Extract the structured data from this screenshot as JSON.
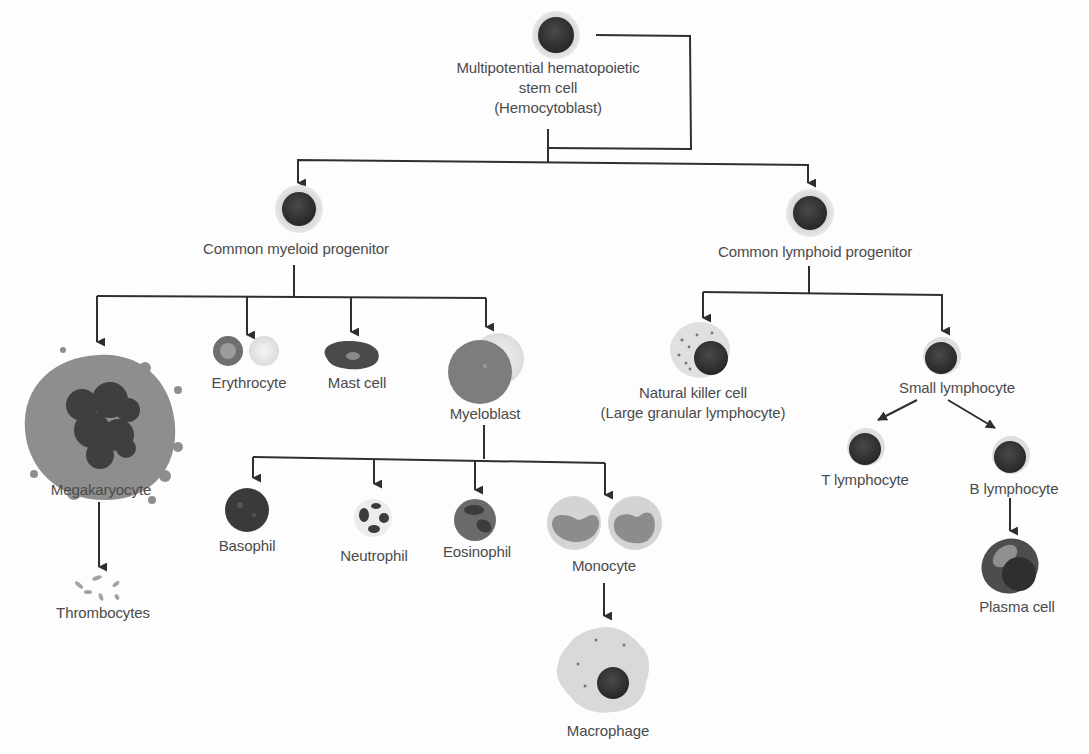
{
  "diagram": {
    "colors": {
      "line": "#2f2f2f",
      "text": "#4b4b4b",
      "nucleus": "#333333",
      "cytoplasm": "#c8c8c8",
      "membrane": "#dedede"
    },
    "nodes": {
      "stem": {
        "label_lines": [
          "Multipotential hematopoietic",
          "stem cell",
          "(Hemocytoblast)"
        ],
        "icon": "stem-cell-icon"
      },
      "myeloid": {
        "label": "Common myeloid progenitor",
        "icon": "progenitor-cell-icon"
      },
      "lymphoid": {
        "label": "Common lymphoid progenitor",
        "icon": "progenitor-cell-icon"
      },
      "megakaryocyte": {
        "label": "Megakaryocyte",
        "icon": "megakaryocyte-icon"
      },
      "thrombocytes": {
        "label": "Thrombocytes",
        "icon": "platelets-icon"
      },
      "erythrocyte": {
        "label": "Erythrocyte",
        "icon": "red-blood-cell-icon"
      },
      "mast": {
        "label": "Mast cell",
        "icon": "mast-cell-icon"
      },
      "myeloblast": {
        "label": "Myeloblast",
        "icon": "myeloblast-icon"
      },
      "basophil": {
        "label": "Basophil",
        "icon": "basophil-icon"
      },
      "neutrophil": {
        "label": "Neutrophil",
        "icon": "neutrophil-icon"
      },
      "eosinophil": {
        "label": "Eosinophil",
        "icon": "eosinophil-icon"
      },
      "monocyte": {
        "label": "Monocyte",
        "icon": "monocyte-icon"
      },
      "macrophage": {
        "label": "Macrophage",
        "icon": "macrophage-icon"
      },
      "nk": {
        "label_lines": [
          "Natural killer cell",
          "(Large granular lymphocyte)"
        ],
        "icon": "nk-cell-icon"
      },
      "small_lymphocyte": {
        "label": "Small lymphocyte",
        "icon": "lymphocyte-icon"
      },
      "t_lymphocyte": {
        "label": "T lymphocyte",
        "icon": "lymphocyte-icon"
      },
      "b_lymphocyte": {
        "label": "B lymphocyte",
        "icon": "lymphocyte-icon"
      },
      "plasma": {
        "label": "Plasma cell",
        "icon": "plasma-cell-icon"
      }
    },
    "edges": [
      [
        "stem",
        "stem (self-renewal loop)"
      ],
      [
        "stem",
        "myeloid"
      ],
      [
        "stem",
        "lymphoid"
      ],
      [
        "myeloid",
        "megakaryocyte"
      ],
      [
        "myeloid",
        "erythrocyte"
      ],
      [
        "myeloid",
        "mast"
      ],
      [
        "myeloid",
        "myeloblast"
      ],
      [
        "megakaryocyte",
        "thrombocytes"
      ],
      [
        "myeloblast",
        "basophil"
      ],
      [
        "myeloblast",
        "neutrophil"
      ],
      [
        "myeloblast",
        "eosinophil"
      ],
      [
        "myeloblast",
        "monocyte"
      ],
      [
        "monocyte",
        "macrophage"
      ],
      [
        "lymphoid",
        "nk"
      ],
      [
        "lymphoid",
        "small_lymphocyte"
      ],
      [
        "small_lymphocyte",
        "t_lymphocyte"
      ],
      [
        "small_lymphocyte",
        "b_lymphocyte"
      ],
      [
        "b_lymphocyte",
        "plasma"
      ]
    ]
  }
}
